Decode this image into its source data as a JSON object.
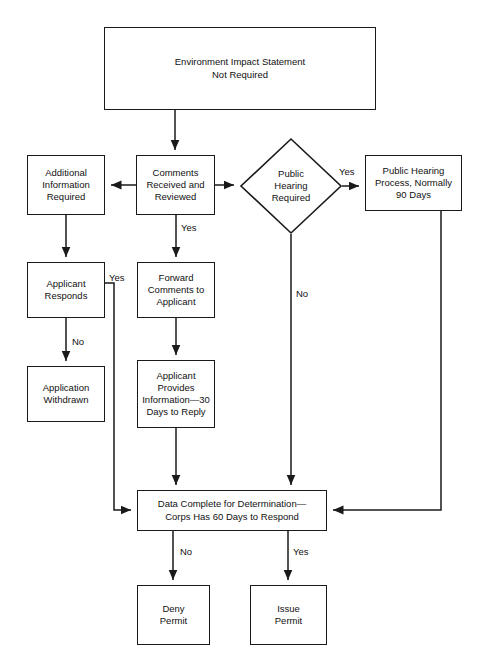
{
  "diagram": {
    "stroke_color": "#1a1a1a",
    "background_color": "#ffffff",
    "nodes": [
      {
        "id": "eis-not-required",
        "shape": "rectangle",
        "label": "Environment Impact Statement\nNot Required",
        "x": 104,
        "y": 27,
        "w": 272,
        "h": 83
      },
      {
        "id": "additional-information-required",
        "shape": "rectangle",
        "label": "Additional\nInformation\nRequired",
        "x": 27,
        "y": 155,
        "w": 78,
        "h": 60
      },
      {
        "id": "comments-received-and-reviewed",
        "shape": "rectangle",
        "label": "Comments\nReceived and\nReviewed",
        "x": 136,
        "y": 155,
        "w": 79,
        "h": 60
      },
      {
        "id": "public-hearing-required",
        "shape": "diamond",
        "label": "Public\nHearing\nRequired",
        "x": 240,
        "y": 138,
        "w": 102,
        "h": 96
      },
      {
        "id": "public-hearing-process",
        "shape": "rectangle",
        "label": "Public Hearing\nProcess, Normally\n90 Days",
        "x": 365,
        "y": 155,
        "w": 97,
        "h": 56
      },
      {
        "id": "applicant-responds",
        "shape": "rectangle",
        "label": "Applicant\nResponds",
        "x": 27,
        "y": 262,
        "w": 78,
        "h": 56
      },
      {
        "id": "forward-comments-to-applicant",
        "shape": "rectangle",
        "label": "Forward\nComments to\nApplicant",
        "x": 137,
        "y": 262,
        "w": 78,
        "h": 56
      },
      {
        "id": "application-withdrawn",
        "shape": "rectangle",
        "label": "Application\nWithdrawn",
        "x": 27,
        "y": 366,
        "w": 78,
        "h": 56
      },
      {
        "id": "applicant-provides-information",
        "shape": "rectangle",
        "label": "Applicant\nProvides\nInformation—30\nDays to Reply",
        "x": 137,
        "y": 360,
        "w": 78,
        "h": 68
      },
      {
        "id": "data-complete-for-determination",
        "shape": "rectangle",
        "label": "Data Complete for Determination—\nCorps Has 60 Days to Respond",
        "x": 137,
        "y": 490,
        "w": 190,
        "h": 41
      },
      {
        "id": "deny-permit",
        "shape": "rectangle",
        "label": "Deny\nPermit",
        "x": 137,
        "y": 585,
        "w": 73,
        "h": 60
      },
      {
        "id": "issue-permit",
        "shape": "rectangle",
        "label": "Issue\nPermit",
        "x": 250,
        "y": 585,
        "w": 77,
        "h": 60
      }
    ],
    "edges": [
      {
        "id": "eis-to-comments",
        "from": "eis-not-required",
        "to": "comments-received-and-reviewed",
        "label": ""
      },
      {
        "id": "comments-to-additional-info",
        "from": "comments-received-and-reviewed",
        "to": "additional-information-required",
        "label": ""
      },
      {
        "id": "comments-to-hearing-decision",
        "from": "comments-received-and-reviewed",
        "to": "public-hearing-required",
        "label": ""
      },
      {
        "id": "comments-to-forward",
        "from": "comments-received-and-reviewed",
        "to": "forward-comments-to-applicant",
        "label": "Yes"
      },
      {
        "id": "hearing-yes-to-process",
        "from": "public-hearing-required",
        "to": "public-hearing-process",
        "label": "Yes"
      },
      {
        "id": "hearing-no-to-data-complete",
        "from": "public-hearing-required",
        "to": "data-complete-for-determination",
        "label": "No"
      },
      {
        "id": "additional-info-to-applicant-responds",
        "from": "additional-information-required",
        "to": "applicant-responds",
        "label": ""
      },
      {
        "id": "applicant-responds-no-to-withdrawn",
        "from": "applicant-responds",
        "to": "application-withdrawn",
        "label": "No"
      },
      {
        "id": "applicant-responds-yes-to-data-complete",
        "from": "applicant-responds",
        "to": "data-complete-for-determination",
        "label": "Yes"
      },
      {
        "id": "forward-to-applicant-provides",
        "from": "forward-comments-to-applicant",
        "to": "applicant-provides-information",
        "label": ""
      },
      {
        "id": "applicant-provides-to-data-complete",
        "from": "applicant-provides-information",
        "to": "data-complete-for-determination",
        "label": ""
      },
      {
        "id": "hearing-process-to-data-complete",
        "from": "public-hearing-process",
        "to": "data-complete-for-determination",
        "label": ""
      },
      {
        "id": "data-complete-no-to-deny",
        "from": "data-complete-for-determination",
        "to": "deny-permit",
        "label": "No"
      },
      {
        "id": "data-complete-yes-to-issue",
        "from": "data-complete-for-determination",
        "to": "issue-permit",
        "label": "Yes"
      }
    ],
    "edge_labels": [
      {
        "id": "label-comments-yes",
        "text": "Yes",
        "x": 181,
        "y": 222
      },
      {
        "id": "label-hearing-yes",
        "text": "Yes",
        "x": 339,
        "y": 166
      },
      {
        "id": "label-hearing-no",
        "text": "No",
        "x": 296,
        "y": 288
      },
      {
        "id": "label-applicant-responds-yes",
        "text": "Yes",
        "x": 109,
        "y": 272
      },
      {
        "id": "label-applicant-responds-no",
        "text": "No",
        "x": 72,
        "y": 336
      },
      {
        "id": "label-data-complete-no",
        "text": "No",
        "x": 180,
        "y": 546
      },
      {
        "id": "label-data-complete-yes",
        "text": "Yes",
        "x": 293,
        "y": 546
      }
    ]
  }
}
